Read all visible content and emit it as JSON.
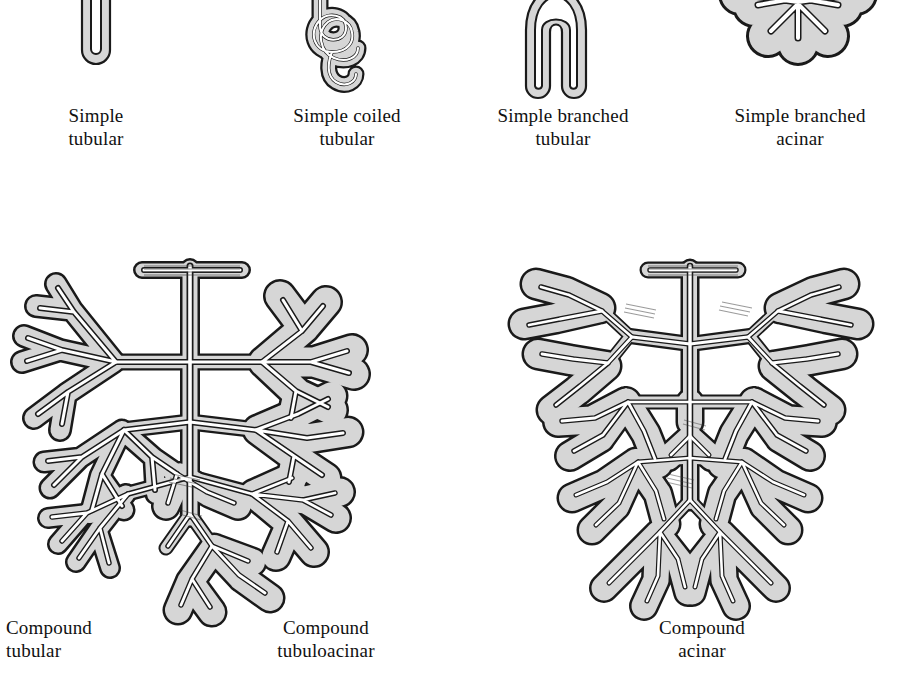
{
  "figure": {
    "kind": "histology-diagram",
    "background_color": "#ffffff",
    "wall_fill_color": "#d6d6d6",
    "outline_color": "#1a1a1a",
    "lumen_color": "#ffffff"
  },
  "rows": [
    {
      "name": "simple-glands-row",
      "items": [
        {
          "id": "simple-tubular",
          "label": "Simple\ntubular",
          "label_line1": "Simple",
          "label_line2": "tubular",
          "shape": "straight unbranched tube with blind rounded end, duct truncated at top"
        },
        {
          "id": "simple-coiled-tubular",
          "label": "Simple coiled\ntubular",
          "label_line1": "Simple coiled",
          "label_line2": "tubular",
          "shape": "single tube coiled into overlapping loops, duct truncated at top"
        },
        {
          "id": "simple-branched-tubular",
          "label": "Simple branched\ntubular",
          "label_line1": "Simple branched",
          "label_line2": "tubular",
          "shape": "inverted-U tube, single duct dividing into two blind tubules"
        },
        {
          "id": "simple-branched-acinar",
          "label": "Simple branched\nacinar",
          "label_line1": "Simple branched",
          "label_line2": "acinar",
          "shape": "cluster of rounded saccular acini on short branched duct, truncated at top"
        }
      ]
    },
    {
      "name": "compound-glands-row",
      "items": [
        {
          "id": "compound-tubular",
          "label": "Compound\ntubular",
          "label_line1": "Compound",
          "label_line2": "tubular",
          "shape": "repeatedly branched duct tree ending in elongated tubular secretory units (left half of tree)"
        },
        {
          "id": "compound-tubuloacinar",
          "label": "Compound\ntubuloacinar",
          "label_line1": "Compound",
          "label_line2": "tubuloacinar",
          "shape": "same branched duct tree bearing both tubular and rounded acinar secretory units (right half of tree)"
        },
        {
          "id": "compound-acinar",
          "label": "Compound\nacinar",
          "label_line1": "Compound",
          "label_line2": "acinar",
          "shape": "repeatedly branched duct tree ending entirely in grape-like clusters of rounded acini"
        }
      ]
    }
  ]
}
